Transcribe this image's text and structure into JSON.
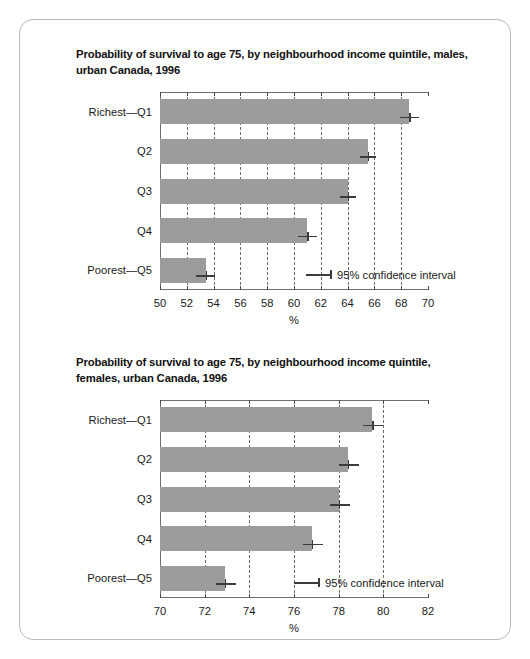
{
  "figure": {
    "frame_color": "#b9b9b9",
    "background": "#ffffff",
    "bar_color": "#9c9c9c",
    "gridline_color": "#6d6d6d",
    "errorbar_color": "#3b3b3b"
  },
  "panels": [
    {
      "title": "Probability of survival to age 75, by neighbourhood income quintile, males, urban Canada, 1996",
      "legend_label": "95% confidence interval",
      "axis_title": "%"
    },
    {
      "title": "Probability of survival to age 75, by neighbourhood income quintile, females, urban Canada, 1996",
      "legend_label": "95% confidence interval",
      "axis_title": "%"
    }
  ],
  "chart_data": [
    {
      "type": "bar",
      "orientation": "horizontal",
      "title": "Probability of survival to age 75, by neighbourhood income quintile, males, urban Canada, 1996",
      "categories": [
        "Richest—Q1",
        "Q2",
        "Q3",
        "Q4",
        "Poorest—Q5"
      ],
      "values": [
        68.6,
        65.5,
        64.0,
        61.0,
        53.4
      ],
      "error_low": [
        67.9,
        64.9,
        63.4,
        60.3,
        52.7
      ],
      "error_high": [
        69.3,
        66.1,
        64.6,
        61.7,
        54.1
      ],
      "xlabel": "%",
      "ylabel": "",
      "xlim": [
        50,
        70
      ],
      "xticks": [
        50,
        52,
        54,
        56,
        58,
        60,
        62,
        64,
        66,
        68,
        70
      ],
      "grid": true,
      "grid_axis": "x",
      "legend": [
        "95% confidence interval"
      ],
      "legend_position": "inside-bottom-right"
    },
    {
      "type": "bar",
      "orientation": "horizontal",
      "title": "Probability of survival to age 75, by neighbourhood income quintile, females, urban Canada, 1996",
      "categories": [
        "Richest—Q1",
        "Q2",
        "Q3",
        "Q4",
        "Poorest—Q5"
      ],
      "values": [
        79.5,
        78.4,
        78.0,
        76.8,
        72.9
      ],
      "error_low": [
        79.1,
        78.0,
        77.6,
        76.4,
        72.5
      ],
      "error_high": [
        80.0,
        78.9,
        78.5,
        77.3,
        73.4
      ],
      "xlabel": "%",
      "ylabel": "",
      "xlim": [
        70,
        82
      ],
      "xticks": [
        70,
        72,
        74,
        76,
        78,
        80,
        82
      ],
      "grid": true,
      "grid_axis": "x",
      "legend": [
        "95% confidence interval"
      ],
      "legend_position": "inside-bottom-right"
    }
  ]
}
